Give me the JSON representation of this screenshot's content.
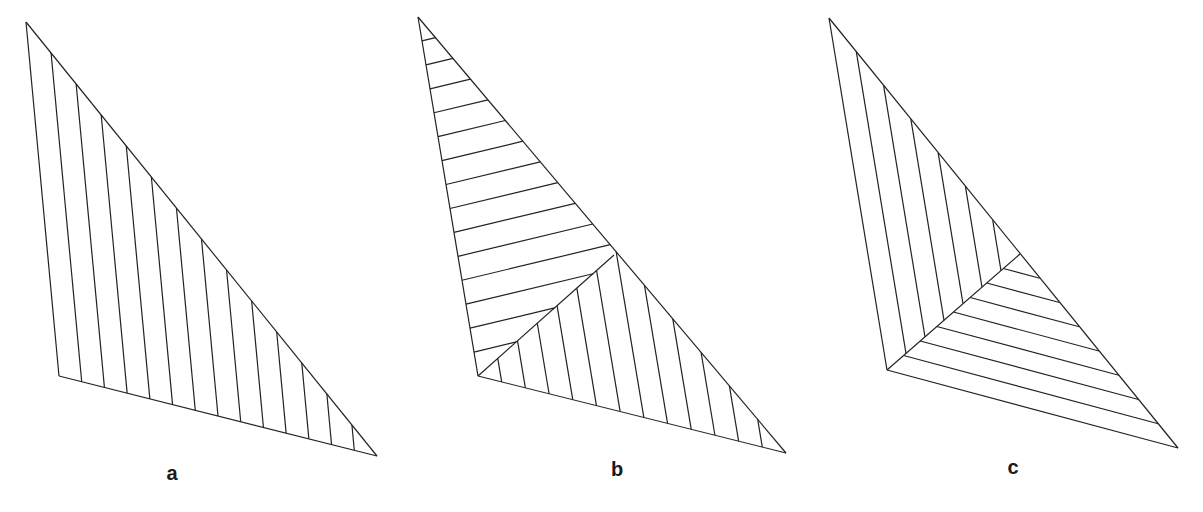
{
  "figure": {
    "stroke_color": "#222222",
    "background": "#ffffff",
    "panels": [
      {
        "id": "a",
        "label": "a",
        "label_pos": [
          172,
          462
        ],
        "vertices": {
          "top": [
            26,
            22
          ],
          "left": [
            59,
            376
          ],
          "right": [
            377,
            456
          ]
        },
        "hatching": "single family of lines parallel to the left edge",
        "line_count": 13
      },
      {
        "id": "b",
        "label": "b",
        "label_pos": [
          617,
          458
        ],
        "vertices": {
          "top": [
            418,
            17
          ],
          "left": [
            478,
            376
          ],
          "right": [
            786,
            453
          ]
        },
        "hatching": "two families: near-horizontal lines in upper part, lines parallel to left edge in lower part, meeting along a spine from the left vertex to the right edge",
        "spine_end": [
          614,
          255
        ],
        "upper_count": 14,
        "lower_count": 12
      },
      {
        "id": "c",
        "label": "c",
        "label_pos": [
          1013,
          456
        ],
        "vertices": {
          "top": [
            829,
            18
          ],
          "left": [
            887,
            370
          ],
          "right": [
            1178,
            448
          ]
        },
        "hatching": "two families: lines parallel to left edge and lines parallel to bottom edge, meeting along the angle bisector from the left vertex",
        "spine_end": [
          1020,
          254
        ],
        "left_family_count": 6,
        "bottom_family_count": 7
      }
    ]
  }
}
